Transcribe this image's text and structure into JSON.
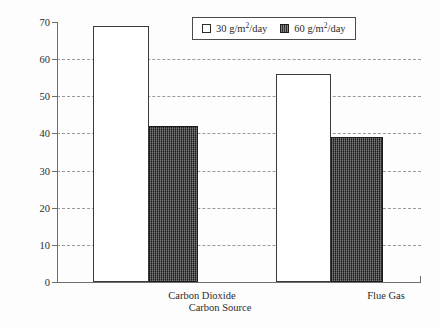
{
  "chart_data": {
    "type": "bar",
    "title": "",
    "xlabel": "Carbon Source",
    "ylabel": "Biodiesel Production Cost ($ per barrel)",
    "categories": [
      "Carbon Dioxide",
      "Flue Gas"
    ],
    "series": [
      {
        "name": "30 g/m2/day",
        "values": [
          69,
          56
        ]
      },
      {
        "name": "60 g/m2/day",
        "values": [
          42,
          39
        ]
      }
    ],
    "ylim": [
      0,
      70
    ],
    "ytick_labels": [
      "0",
      "10",
      "20",
      "30",
      "40",
      "50",
      "60",
      "70"
    ],
    "ytick_values": [
      0,
      10,
      20,
      30,
      40,
      50,
      60,
      70
    ],
    "grid": "horizontal-dashed",
    "legend_position": "top-center",
    "legend": [
      {
        "label_prefix": "30 g/m",
        "label_sup": "2",
        "label_suffix": "/day",
        "swatch": "light"
      },
      {
        "label_prefix": "60 g/m",
        "label_sup": "2",
        "label_suffix": "/day",
        "swatch": "dark"
      }
    ]
  },
  "colors": {
    "light_bar": "#ffffff",
    "dark_bar": "#3c3c3c",
    "axis": "#6e6e6e",
    "grid": "#9a9a9a",
    "text": "#2b2b2b",
    "background": "#fdfdfd"
  }
}
